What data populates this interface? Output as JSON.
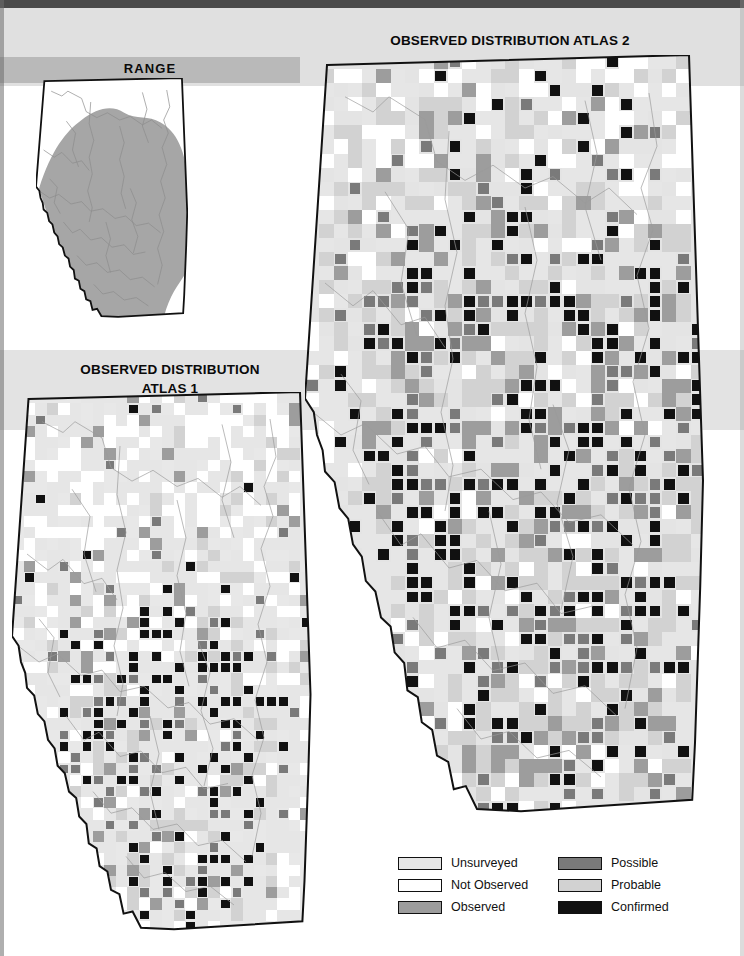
{
  "page": {
    "background": "#ffffff",
    "bands": {
      "top_dark": "#4a4a4a",
      "upper_light": "#e0e0e0",
      "range_band": "#b9b9b9",
      "mid_light": "#e3e3e3"
    }
  },
  "titles": {
    "range": "RANGE",
    "atlas2": "OBSERVED DISTRIBUTION ATLAS 2",
    "atlas1_line1": "OBSERVED DISTRIBUTION",
    "atlas1_line2": "ATLAS 1",
    "atlas1_full": "OBSERVED DISTRIBUTION ATLAS 1"
  },
  "legend": {
    "columns": [
      {
        "name": "left",
        "items": [
          {
            "label": "Unsurveyed",
            "color": "#e6e6e6"
          },
          {
            "label": "Not Observed",
            "color": "#ffffff"
          },
          {
            "label": "Observed",
            "color": "#9d9d9d"
          }
        ]
      },
      {
        "name": "right",
        "items": [
          {
            "label": "Possible",
            "color": "#7a7a7a"
          },
          {
            "label": "Probable",
            "color": "#d2d2d2"
          },
          {
            "label": "Confirmed",
            "color": "#111111"
          }
        ]
      }
    ]
  },
  "maps": [
    {
      "id": "range",
      "name": "RANGE",
      "region": "Alberta",
      "kind": "range-shading",
      "outline_color": "#111111",
      "fill_color": "#ffffff",
      "range_fill": "#a6a6a6",
      "river_color": "#8c8c8c"
    },
    {
      "id": "atlas2",
      "name": "OBSERVED DISTRIBUTION ATLAS 2",
      "region": "Alberta",
      "kind": "grid-squares",
      "outline_color": "#111111",
      "base_fill": "#e4e4e4",
      "river_color": "#9a9a9a",
      "grid_cols": 28,
      "grid_rows": 54,
      "cell_counts": {
        "unsurveyed": 760,
        "not_observed": 300,
        "observed": 150,
        "possible": 95,
        "probable": 120,
        "confirmed": 105
      }
    },
    {
      "id": "atlas1",
      "name": "OBSERVED DISTRIBUTION ATLAS 1",
      "region": "Alberta",
      "kind": "grid-squares",
      "outline_color": "#111111",
      "base_fill": "#e8e8e8",
      "river_color": "#9a9a9a",
      "grid_cols": 26,
      "grid_rows": 48,
      "cell_counts": {
        "unsurveyed": 700,
        "not_observed": 360,
        "observed": 90,
        "possible": 60,
        "probable": 70,
        "confirmed": 130
      }
    }
  ]
}
